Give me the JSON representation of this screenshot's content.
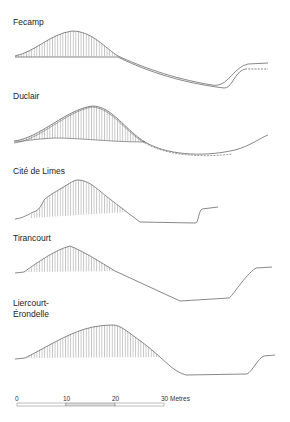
{
  "profiles": [
    {
      "name": "Fecamp",
      "label_lines": [
        "Fecamp"
      ]
    },
    {
      "name": "Duclair",
      "label_lines": [
        "Duclair"
      ]
    },
    {
      "name": "Cité de Limes",
      "label_lines": [
        "Cité de Limes"
      ]
    },
    {
      "name": "Tirancourt",
      "label_lines": [
        "Tirancourt"
      ]
    },
    {
      "name": "Liercourt-Érondelle",
      "label_lines": [
        "Liercourt-",
        "Érondelle"
      ]
    }
  ],
  "scale_bar": {
    "ticks": [
      "0",
      "10",
      "20",
      "30 Metres"
    ],
    "unit": "Metres"
  },
  "colors": {
    "line": "#555555",
    "hatch": "#777777",
    "scale_fill": "#dddddd"
  }
}
